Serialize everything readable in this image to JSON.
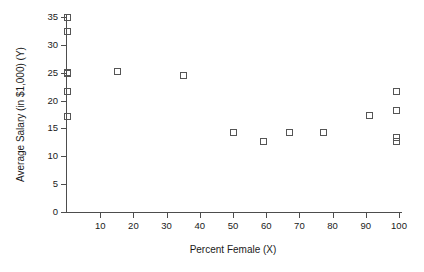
{
  "chart_data": {
    "type": "scatter",
    "title": "",
    "xlabel": "Percent Female (X)",
    "ylabel": "Average Salary (in $1,000) (Y)",
    "xlim": [
      0,
      103
    ],
    "ylim": [
      0,
      36
    ],
    "grid": false,
    "legend": null,
    "xticks": [
      10,
      20,
      30,
      40,
      50,
      60,
      70,
      80,
      90,
      100
    ],
    "xticklabels": [
      "10",
      "20",
      "30",
      "40",
      "50",
      "60",
      "70",
      "80",
      "90",
      "100"
    ],
    "yticks": [
      0,
      5,
      10,
      15,
      20,
      25,
      30,
      35
    ],
    "yticklabels": [
      "0",
      "5",
      "10",
      "15",
      "20",
      "25",
      "30",
      "35"
    ],
    "marker": "open-square",
    "marker_color": "#555555",
    "points": [
      {
        "x": 0,
        "y": 35.0
      },
      {
        "x": 0,
        "y": 32.5
      },
      {
        "x": 0,
        "y": 25.2
      },
      {
        "x": 0,
        "y": 25.0
      },
      {
        "x": 0,
        "y": 21.7
      },
      {
        "x": 0,
        "y": 17.3
      },
      {
        "x": 15,
        "y": 25.3
      },
      {
        "x": 35,
        "y": 24.6
      },
      {
        "x": 50,
        "y": 14.3
      },
      {
        "x": 59,
        "y": 12.8
      },
      {
        "x": 67,
        "y": 14.3
      },
      {
        "x": 77,
        "y": 14.3
      },
      {
        "x": 91,
        "y": 17.5
      },
      {
        "x": 99,
        "y": 21.8
      },
      {
        "x": 99,
        "y": 18.3
      },
      {
        "x": 99,
        "y": 13.5
      },
      {
        "x": 99,
        "y": 12.7
      }
    ]
  },
  "axes": {
    "x_title": "Percent Female (X)",
    "y_title": "Average Salary (in $1,000) (Y)"
  }
}
